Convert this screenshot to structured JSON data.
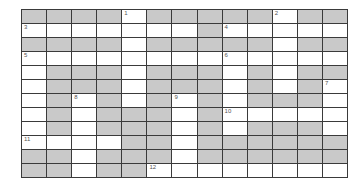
{
  "puzzle": {
    "type": "crossword",
    "columns": 13,
    "rows": 12,
    "colors": {
      "block": "#c9c9c9",
      "open": "#ffffff",
      "line": "#3a3a3a",
      "number": "#555555"
    },
    "grid": [
      [
        0,
        0,
        0,
        0,
        1,
        0,
        0,
        0,
        0,
        0,
        1,
        0,
        0
      ],
      [
        1,
        1,
        1,
        1,
        1,
        1,
        1,
        0,
        1,
        1,
        1,
        1,
        1
      ],
      [
        0,
        0,
        0,
        0,
        1,
        0,
        0,
        0,
        0,
        0,
        1,
        0,
        0
      ],
      [
        1,
        1,
        1,
        1,
        1,
        1,
        1,
        1,
        1,
        1,
        1,
        1,
        1
      ],
      [
        1,
        0,
        0,
        0,
        1,
        0,
        0,
        0,
        1,
        0,
        1,
        0,
        0
      ],
      [
        1,
        0,
        0,
        0,
        1,
        0,
        0,
        0,
        1,
        0,
        1,
        0,
        1
      ],
      [
        1,
        0,
        1,
        0,
        1,
        0,
        1,
        0,
        1,
        0,
        0,
        0,
        1
      ],
      [
        1,
        0,
        1,
        0,
        0,
        0,
        1,
        0,
        1,
        1,
        1,
        1,
        1
      ],
      [
        1,
        0,
        1,
        0,
        0,
        0,
        1,
        0,
        1,
        0,
        0,
        0,
        1
      ],
      [
        1,
        1,
        1,
        1,
        0,
        0,
        1,
        0,
        0,
        0,
        0,
        0,
        0
      ],
      [
        0,
        0,
        1,
        0,
        0,
        0,
        1,
        0,
        0,
        0,
        0,
        0,
        0
      ],
      [
        0,
        0,
        1,
        0,
        0,
        1,
        1,
        1,
        1,
        1,
        1,
        1,
        1
      ]
    ],
    "numbers": [
      {
        "label": "1",
        "row": 0,
        "col": 4
      },
      {
        "label": "2",
        "row": 0,
        "col": 10
      },
      {
        "label": "3",
        "row": 1,
        "col": 0
      },
      {
        "label": "4",
        "row": 1,
        "col": 8
      },
      {
        "label": "5",
        "row": 3,
        "col": 0
      },
      {
        "label": "6",
        "row": 3,
        "col": 8
      },
      {
        "label": "7",
        "row": 5,
        "col": 12
      },
      {
        "label": "8",
        "row": 6,
        "col": 2
      },
      {
        "label": "9",
        "row": 6,
        "col": 6
      },
      {
        "label": "10",
        "row": 7,
        "col": 8
      },
      {
        "label": "11",
        "row": 9,
        "col": 0
      },
      {
        "label": "12",
        "row": 11,
        "col": 5
      }
    ]
  }
}
